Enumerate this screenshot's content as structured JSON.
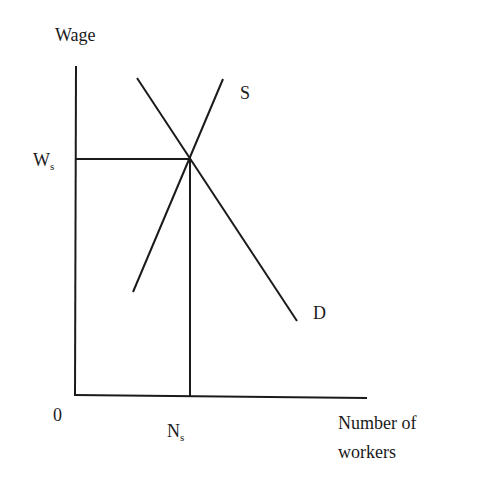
{
  "diagram": {
    "type": "labour-market-supply-demand",
    "y_axis_label": "Wage",
    "x_axis_label_line1": "Number of",
    "x_axis_label_line2": "workers",
    "origin_label": "0",
    "equilibrium_wage": {
      "main": "W",
      "sub": "s"
    },
    "equilibrium_quantity": {
      "main": "N",
      "sub": "s"
    },
    "supply_curve_label": "S",
    "demand_curve_label": "D",
    "line_color": "#1a1a1a",
    "geometry": {
      "y_axis": {
        "x1": 76,
        "y1": 66,
        "x2": 75,
        "y2": 395
      },
      "x_axis": {
        "x1": 74,
        "y1": 395,
        "x2": 367,
        "y2": 398
      },
      "supply": {
        "x1": 133,
        "y1": 292,
        "x2": 223,
        "y2": 79
      },
      "demand": {
        "x1": 137,
        "y1": 78,
        "x2": 297,
        "y2": 321
      },
      "wage_guide": {
        "x1": 76,
        "y1": 159,
        "x2": 190,
        "y2": 159
      },
      "quantity_guide": {
        "x1": 190,
        "y1": 157,
        "x2": 190,
        "y2": 396
      },
      "equilibrium_point": {
        "x": 190,
        "y": 157
      }
    }
  }
}
